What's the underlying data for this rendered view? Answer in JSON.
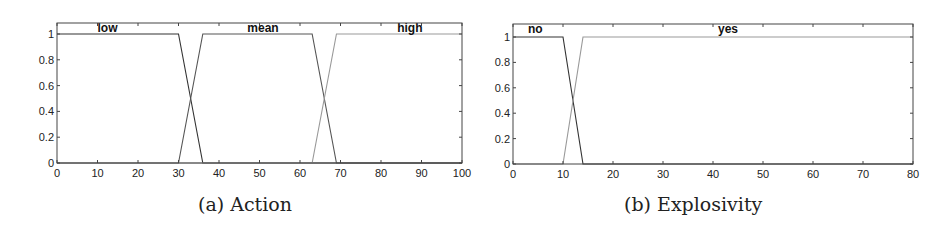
{
  "chart_data": [
    {
      "id": "a",
      "type": "line",
      "title": "",
      "caption": "(a) Action",
      "xlabel": "",
      "ylabel": "",
      "xlim": [
        0,
        100
      ],
      "ylim": [
        0,
        1.1
      ],
      "xticks": [
        0,
        10,
        20,
        30,
        40,
        50,
        60,
        70,
        80,
        90,
        100
      ],
      "yticks": [
        0,
        0.2,
        0.4,
        0.6,
        0.8,
        1
      ],
      "ytick_labels": [
        "0",
        "0.2",
        "0.4",
        "0.6",
        "0.8",
        "1"
      ],
      "grid": false,
      "legend": "inline labels at top",
      "series": [
        {
          "name": "low",
          "color": "#333333",
          "x": [
            0,
            30,
            36,
            100
          ],
          "y": [
            1,
            1,
            0,
            0
          ],
          "label_x": 10
        },
        {
          "name": "mean",
          "color": "#555555",
          "x": [
            0,
            30,
            36,
            63,
            69,
            100
          ],
          "y": [
            0,
            0,
            1,
            1,
            0,
            0
          ],
          "label_x": 47
        },
        {
          "name": "high",
          "color": "#999999",
          "x": [
            0,
            63,
            69,
            100
          ],
          "y": [
            0,
            0,
            1,
            1
          ],
          "label_x": 84
        }
      ],
      "box": {
        "left": 57,
        "top": 23,
        "right": 462,
        "bottom": 163,
        "y1_px": 34
      }
    },
    {
      "id": "b",
      "type": "line",
      "title": "",
      "caption": "(b) Explosivity",
      "xlabel": "",
      "ylabel": "",
      "xlim": [
        0,
        80
      ],
      "ylim": [
        0,
        1.1
      ],
      "xticks": [
        0,
        10,
        20,
        30,
        40,
        50,
        60,
        70,
        80
      ],
      "yticks": [
        0,
        0.2,
        0.4,
        0.6,
        0.8,
        1
      ],
      "ytick_labels": [
        "0",
        "0.2",
        "0.4",
        "0.6",
        "0.8",
        "1"
      ],
      "grid": false,
      "legend": "inline labels at top",
      "series": [
        {
          "name": "no",
          "color": "#333333",
          "x": [
            0,
            10,
            14,
            80
          ],
          "y": [
            1,
            1,
            0,
            0
          ],
          "label_x": 3
        },
        {
          "name": "yes",
          "color": "#999999",
          "x": [
            0,
            10,
            14,
            80
          ],
          "y": [
            0,
            0,
            1,
            1
          ],
          "label_x": 41
        }
      ],
      "box": {
        "left": 38,
        "top": 24,
        "right": 438,
        "bottom": 164,
        "y1_px": 37
      }
    }
  ]
}
